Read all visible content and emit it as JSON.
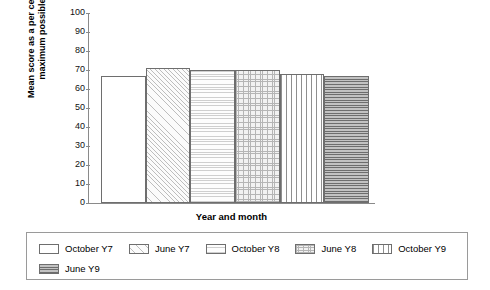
{
  "chart_data": {
    "type": "bar",
    "title": "",
    "xlabel": "Year and month",
    "ylabel": "Mean score as a per cent of maximum possible",
    "categories": [
      "October Y7",
      "June Y7",
      "October Y8",
      "June Y8",
      "October Y9",
      "June Y9"
    ],
    "values": [
      67,
      71,
      70,
      70,
      68,
      67
    ],
    "ylim": [
      0,
      100
    ],
    "yticks": [
      "100",
      "90",
      "80",
      "70",
      "60",
      "50",
      "40",
      "30",
      "20",
      "10",
      "0"
    ],
    "grid": false,
    "legend_position": "bottom",
    "series": [
      {
        "name": "Mean score",
        "values": [
          67,
          71,
          70,
          70,
          68,
          67
        ]
      }
    ]
  },
  "axis": {
    "y_title_line1": "Mean score as a per cent of",
    "y_title_line2": "maximum possible",
    "x_title": "Year and month",
    "ticks": [
      "100",
      "90",
      "80",
      "70",
      "60",
      "50",
      "40",
      "30",
      "20",
      "10",
      "0"
    ]
  },
  "legend": {
    "items": [
      {
        "label": "October Y7",
        "pattern": "plain",
        "swatch_name": "legend-swatch-october-y7"
      },
      {
        "label": "June Y7",
        "pattern": "diagonal-hatch",
        "swatch_name": "legend-swatch-june-y7"
      },
      {
        "label": "October Y8",
        "pattern": "horizontal-dots",
        "swatch_name": "legend-swatch-october-y8"
      },
      {
        "label": "June Y8",
        "pattern": "crosshatch",
        "swatch_name": "legend-swatch-june-y8"
      },
      {
        "label": "October Y9",
        "pattern": "vertical-dashes",
        "swatch_name": "legend-swatch-october-y9"
      },
      {
        "label": "June Y9",
        "pattern": "horizontal-lines",
        "swatch_name": "legend-swatch-june-y9"
      }
    ]
  },
  "colors": {
    "axis": "#8a8a8a",
    "bar_outline": "#6e6e6e",
    "text": "#000000",
    "legend_border": "#9a9a9a"
  }
}
